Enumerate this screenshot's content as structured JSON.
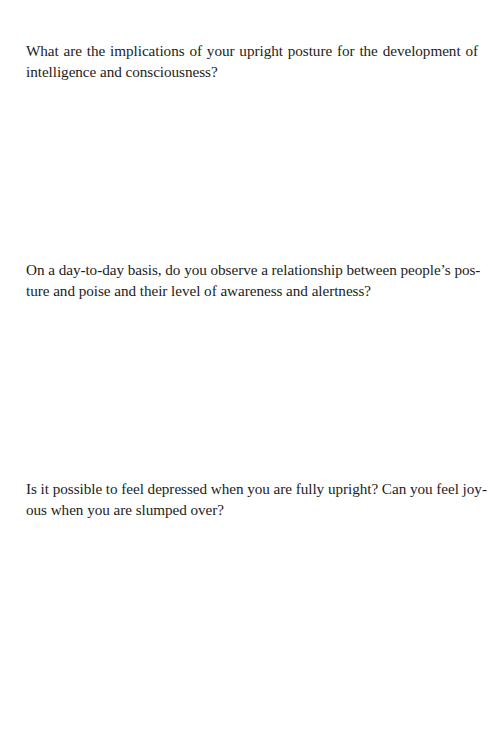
{
  "page": {
    "background": "#ffffff",
    "text_color": "#1c1c1c"
  },
  "questions": [
    {
      "lines": [
        "What are the implications of your upright posture for the development of",
        "intelligence and consciousness?"
      ]
    },
    {
      "lines": [
        "On a day-to-day basis, do you observe a relationship between people’s pos-",
        "ture and poise and their level of awareness and alertness?"
      ]
    },
    {
      "lines": [
        "Is it possible to feel depressed when you are fully upright? Can you feel joy-",
        "ous when you are slumped over?"
      ]
    }
  ]
}
